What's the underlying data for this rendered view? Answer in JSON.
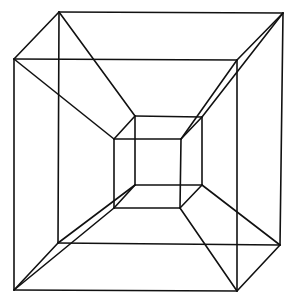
{
  "diagram": {
    "title": "",
    "type": "tesseract-projection",
    "stroke_color": "#111111",
    "background": "#ffffff",
    "vertices": {
      "outer_back_tl": [
        59,
        12
      ],
      "outer_back_tr": [
        283,
        13
      ],
      "outer_back_br": [
        280,
        245
      ],
      "outer_back_bl": [
        58,
        243
      ],
      "outer_front_tl": [
        14,
        59
      ],
      "outer_front_tr": [
        237,
        60
      ],
      "outer_front_br": [
        237,
        291
      ],
      "outer_front_bl": [
        14,
        290
      ],
      "inner_back_tl": [
        135,
        116
      ],
      "inner_back_tr": [
        202,
        117
      ],
      "inner_back_br": [
        202,
        185
      ],
      "inner_back_bl": [
        135,
        185
      ],
      "inner_front_tl": [
        114,
        139
      ],
      "inner_front_tr": [
        181,
        139
      ],
      "inner_front_br": [
        180,
        208
      ],
      "inner_front_bl": [
        114,
        208
      ]
    },
    "edges": [
      [
        "outer_back_tl",
        "outer_back_tr"
      ],
      [
        "outer_back_tr",
        "outer_back_br"
      ],
      [
        "outer_back_br",
        "outer_back_bl"
      ],
      [
        "outer_back_bl",
        "outer_back_tl"
      ],
      [
        "outer_front_tl",
        "outer_front_tr"
      ],
      [
        "outer_front_tr",
        "outer_front_br"
      ],
      [
        "outer_front_br",
        "outer_front_bl"
      ],
      [
        "outer_front_bl",
        "outer_front_tl"
      ],
      [
        "outer_back_tl",
        "outer_front_tl"
      ],
      [
        "outer_back_tr",
        "outer_front_tr"
      ],
      [
        "outer_back_br",
        "outer_front_br"
      ],
      [
        "outer_back_bl",
        "outer_front_bl"
      ],
      [
        "inner_back_tl",
        "inner_back_tr"
      ],
      [
        "inner_back_tr",
        "inner_back_br"
      ],
      [
        "inner_back_br",
        "inner_back_bl"
      ],
      [
        "inner_back_bl",
        "inner_back_tl"
      ],
      [
        "inner_front_tl",
        "inner_front_tr"
      ],
      [
        "inner_front_tr",
        "inner_front_br"
      ],
      [
        "inner_front_br",
        "inner_front_bl"
      ],
      [
        "inner_front_bl",
        "inner_front_tl"
      ],
      [
        "inner_back_tl",
        "inner_front_tl"
      ],
      [
        "inner_back_tr",
        "inner_front_tr"
      ],
      [
        "inner_back_br",
        "inner_front_br"
      ],
      [
        "inner_back_bl",
        "inner_front_bl"
      ],
      [
        "outer_back_tl",
        "inner_back_tl"
      ],
      [
        "outer_front_tl",
        "inner_front_tl"
      ],
      [
        "outer_back_tr",
        "inner_back_tr"
      ],
      [
        "outer_front_tr",
        "inner_front_tr"
      ],
      [
        "outer_back_br",
        "inner_back_br"
      ],
      [
        "outer_front_br",
        "inner_front_br"
      ],
      [
        "outer_back_bl",
        "inner_back_bl"
      ],
      [
        "outer_front_bl",
        "inner_front_bl"
      ]
    ]
  }
}
